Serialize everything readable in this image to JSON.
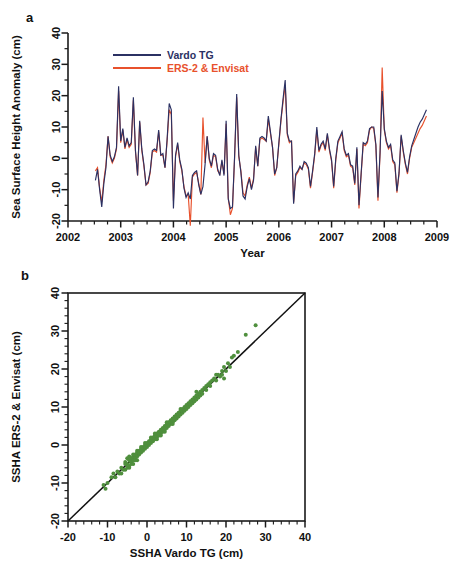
{
  "figure": {
    "panel_a_label": "a",
    "panel_b_label": "b"
  },
  "chart_data": [
    {
      "id": "panel-a",
      "type": "line",
      "title": "",
      "xlabel": "Year",
      "ylabel": "Sea Surface Height  Anomaly (cm)",
      "xlim": [
        2002,
        2009
      ],
      "ylim": [
        -20,
        40
      ],
      "xticks": [
        2002,
        2003,
        2004,
        2005,
        2006,
        2007,
        2008,
        2009
      ],
      "yticks": [
        -20,
        -10,
        0,
        10,
        20,
        30,
        40
      ],
      "xtick_labels": [
        "2002",
        "2003",
        "2004",
        "2005",
        "2006",
        "2007",
        "2008",
        "2009"
      ],
      "ytick_labels": [
        "-20",
        "-10",
        "0",
        "10",
        "20",
        "30",
        "40"
      ],
      "minor_ticks_per_major_x": 4,
      "minor_ticks_per_major_y": 2,
      "grid": false,
      "legend_position": "top-center",
      "legend": [
        {
          "name": "Vardo TG",
          "color": "#2b3163"
        },
        {
          "name": "ERS-2 & Envisat",
          "color": "#e8512c"
        }
      ],
      "x": [
        2002.52,
        2002.56,
        2002.6,
        2002.64,
        2002.68,
        2002.72,
        2002.76,
        2002.8,
        2002.84,
        2002.88,
        2002.92,
        2002.96,
        2003.0,
        2003.04,
        2003.08,
        2003.12,
        2003.16,
        2003.2,
        2003.24,
        2003.28,
        2003.32,
        2003.36,
        2003.4,
        2003.44,
        2003.48,
        2003.52,
        2003.56,
        2003.6,
        2003.64,
        2003.68,
        2003.72,
        2003.76,
        2003.8,
        2003.84,
        2003.88,
        2003.92,
        2003.96,
        2004.0,
        2004.04,
        2004.08,
        2004.12,
        2004.16,
        2004.2,
        2004.24,
        2004.28,
        2004.32,
        2004.36,
        2004.4,
        2004.44,
        2004.48,
        2004.52,
        2004.56,
        2004.6,
        2004.64,
        2004.68,
        2004.72,
        2004.76,
        2004.8,
        2004.84,
        2004.88,
        2004.92,
        2004.96,
        2005.0,
        2005.04,
        2005.08,
        2005.12,
        2005.16,
        2005.2,
        2005.24,
        2005.28,
        2005.32,
        2005.36,
        2005.4,
        2005.44,
        2005.48,
        2005.52,
        2005.56,
        2005.6,
        2005.64,
        2005.68,
        2005.72,
        2005.76,
        2005.8,
        2005.84,
        2005.88,
        2005.92,
        2005.96,
        2006.0,
        2006.04,
        2006.08,
        2006.12,
        2006.16,
        2006.2,
        2006.24,
        2006.28,
        2006.32,
        2006.36,
        2006.4,
        2006.44,
        2006.48,
        2006.52,
        2006.56,
        2006.6,
        2006.64,
        2006.68,
        2006.72,
        2006.76,
        2006.8,
        2006.84,
        2006.88,
        2006.92,
        2006.96,
        2007.0,
        2007.04,
        2007.08,
        2007.12,
        2007.16,
        2007.2,
        2007.24,
        2007.28,
        2007.32,
        2007.36,
        2007.4,
        2007.44,
        2007.48,
        2007.52,
        2007.56,
        2007.6,
        2007.64,
        2007.68,
        2007.72,
        2007.76,
        2007.8,
        2007.84,
        2007.88,
        2007.92,
        2007.96,
        2008.0,
        2008.04,
        2008.08,
        2008.12,
        2008.16,
        2008.2,
        2008.24,
        2008.28,
        2008.32,
        2008.36,
        2008.4,
        2008.44,
        2008.48,
        2008.52,
        2008.56,
        2008.6,
        2008.64,
        2008.68,
        2008.72,
        2008.76,
        2008.8
      ],
      "series": [
        {
          "name": "Vardo TG",
          "color": "#2b3163",
          "values": [
            -7.0,
            -3.5,
            -10.0,
            -15.5,
            -8.0,
            -3.0,
            7.0,
            1.0,
            -1.0,
            0.5,
            3.5,
            23.0,
            5.5,
            9.5,
            3.5,
            6.5,
            4.0,
            5.0,
            19.5,
            2.5,
            -5.5,
            12.0,
            3.0,
            -2.0,
            -8.5,
            -7.5,
            -4.0,
            2.5,
            3.0,
            2.5,
            9.0,
            1.0,
            1.5,
            -3.0,
            6.0,
            17.5,
            15.5,
            -16.0,
            1.0,
            5.0,
            -0.5,
            -3.5,
            -9.5,
            -12.5,
            -11.0,
            -13.0,
            -5.5,
            -4.5,
            -4.0,
            -8.5,
            -11.5,
            -9.0,
            -2.0,
            7.0,
            0.0,
            -2.5,
            1.5,
            1.0,
            -3.5,
            -5.5,
            -0.5,
            -5.5,
            12.0,
            -13.0,
            -16.0,
            -15.5,
            0.5,
            20.5,
            1.0,
            -4.5,
            -12.0,
            -13.0,
            -9.0,
            -6.5,
            -10.0,
            -7.0,
            4.0,
            -2.5,
            6.5,
            7.0,
            6.5,
            5.5,
            13.5,
            8.5,
            3.5,
            -5.0,
            -3.0,
            5.0,
            12.5,
            19.0,
            25.0,
            8.0,
            5.5,
            5.5,
            -14.5,
            -5.0,
            -4.0,
            -2.5,
            -3.5,
            -1.0,
            -1.5,
            -3.0,
            -9.0,
            -4.0,
            1.5,
            10.0,
            2.5,
            4.5,
            5.5,
            3.0,
            8.0,
            3.0,
            -0.5,
            -9.0,
            0.0,
            5.5,
            7.0,
            8.5,
            3.0,
            1.0,
            1.5,
            -2.0,
            -2.5,
            -8.0,
            3.5,
            -15.0,
            -5.0,
            5.0,
            4.5,
            5.5,
            9.5,
            10.0,
            10.0,
            4.5,
            -12.5,
            2.0,
            21.5,
            9.5,
            5.5,
            3.5,
            4.5,
            -0.5,
            -1.5,
            -10.5,
            -4.5,
            7.5,
            2.5,
            -1.5,
            -4.5,
            0.5,
            4.0,
            6.0,
            8.0,
            10.0,
            11.5,
            12.5,
            14.0,
            15.5
          ]
        },
        {
          "name": "ERS-2 & Envisat",
          "color": "#e8512c",
          "values": [
            -4.0,
            -3.0,
            -9.5,
            -14.0,
            -7.0,
            -2.0,
            7.0,
            0.5,
            -1.5,
            0.0,
            3.0,
            21.5,
            5.0,
            9.0,
            3.0,
            6.0,
            3.5,
            4.5,
            18.5,
            2.0,
            -5.5,
            11.5,
            2.5,
            -2.5,
            -8.5,
            -8.0,
            -4.5,
            2.0,
            2.5,
            2.0,
            8.5,
            1.0,
            1.0,
            -3.0,
            5.5,
            15.5,
            14.0,
            -13.5,
            0.5,
            4.5,
            -1.0,
            -4.0,
            -9.0,
            -12.0,
            -11.5,
            -21.5,
            -6.0,
            -5.0,
            -4.5,
            -8.0,
            -11.5,
            13.0,
            -1.5,
            7.0,
            -0.5,
            -3.0,
            1.0,
            0.5,
            -4.0,
            -5.0,
            -1.0,
            -5.0,
            11.0,
            -12.5,
            -18.0,
            -16.0,
            0.0,
            19.5,
            0.5,
            -4.0,
            -11.0,
            -12.0,
            -8.5,
            -6.0,
            -9.5,
            -6.5,
            3.5,
            -2.5,
            6.0,
            6.5,
            6.0,
            5.5,
            12.5,
            8.0,
            3.5,
            -5.5,
            -3.0,
            4.5,
            12.0,
            18.0,
            23.5,
            7.5,
            5.0,
            5.5,
            -14.0,
            -5.5,
            -4.5,
            -3.0,
            -3.5,
            -1.5,
            -2.0,
            -3.5,
            -9.5,
            -4.5,
            1.0,
            9.0,
            2.0,
            4.0,
            5.0,
            2.5,
            7.5,
            2.5,
            -1.0,
            -9.5,
            -0.5,
            5.0,
            6.5,
            8.0,
            2.5,
            0.5,
            1.0,
            -2.5,
            -3.0,
            -8.5,
            3.0,
            -16.0,
            -5.5,
            4.5,
            4.0,
            5.0,
            9.0,
            10.0,
            9.5,
            4.0,
            -13.5,
            1.5,
            29.0,
            9.0,
            5.0,
            3.0,
            4.0,
            -1.0,
            -2.0,
            -11.0,
            -5.0,
            7.0,
            2.0,
            -2.0,
            -5.0,
            0.0,
            3.5,
            5.0,
            6.5,
            8.0,
            9.5,
            10.5,
            12.0,
            13.5
          ]
        }
      ]
    },
    {
      "id": "panel-b",
      "type": "scatter",
      "title": "",
      "xlabel": "SSHA Vardo TG (cm)",
      "ylabel": "SSHA  ERS-2 & Envisat (cm)",
      "xlim": [
        -20,
        40
      ],
      "ylim": [
        -20,
        40
      ],
      "xticks": [
        -20,
        -10,
        0,
        10,
        20,
        30,
        40
      ],
      "yticks": [
        -20,
        -10,
        0,
        10,
        20,
        30,
        40
      ],
      "xtick_labels": [
        "-20",
        "-10",
        "0",
        "10",
        "20",
        "30",
        "40"
      ],
      "ytick_labels": [
        "-20",
        "-10",
        "0",
        "10",
        "20",
        "30",
        "40"
      ],
      "minor_ticks_per_major": 5,
      "grid": false,
      "legend_position": "none",
      "point_color": "#4f8f3d",
      "point_size": 2.0,
      "reference_line": {
        "name": "1:1 line",
        "color": "#111111",
        "from": [
          -20,
          -20
        ],
        "to": [
          40,
          40
        ]
      },
      "points": [
        [
          -11.0,
          -10.5
        ],
        [
          -10.5,
          -11.5
        ],
        [
          -10.0,
          -10.0
        ],
        [
          -8.5,
          -7.5
        ],
        [
          -7.5,
          -7.0
        ],
        [
          -7.0,
          -7.5
        ],
        [
          -6.5,
          -6.0
        ],
        [
          -6.0,
          -6.5
        ],
        [
          -5.5,
          -4.5
        ],
        [
          -5.5,
          -6.5
        ],
        [
          -5.0,
          -3.5
        ],
        [
          -5.0,
          -5.0
        ],
        [
          -5.0,
          -6.0
        ],
        [
          -4.5,
          -4.0
        ],
        [
          -4.5,
          -5.5
        ],
        [
          -4.5,
          -3.0
        ],
        [
          -4.0,
          -4.5
        ],
        [
          -4.0,
          -3.5
        ],
        [
          -4.0,
          -5.0
        ],
        [
          -3.5,
          -3.0
        ],
        [
          -3.5,
          -4.0
        ],
        [
          -3.5,
          -2.5
        ],
        [
          -3.0,
          -3.5
        ],
        [
          -3.0,
          -2.5
        ],
        [
          -3.0,
          -4.0
        ],
        [
          -2.5,
          -2.0
        ],
        [
          -2.5,
          -3.0
        ],
        [
          -2.5,
          -1.5
        ],
        [
          -2.0,
          -2.5
        ],
        [
          -2.0,
          -1.5
        ],
        [
          -2.0,
          -2.0
        ],
        [
          -1.5,
          -1.0
        ],
        [
          -1.5,
          -2.0
        ],
        [
          -1.5,
          -1.5
        ],
        [
          -1.0,
          -0.5
        ],
        [
          -1.0,
          -1.5
        ],
        [
          -1.0,
          -1.0
        ],
        [
          -0.5,
          0.0
        ],
        [
          -0.5,
          -1.0
        ],
        [
          -0.5,
          -0.5
        ],
        [
          0.0,
          0.5
        ],
        [
          0.0,
          -0.5
        ],
        [
          0.0,
          0.0
        ],
        [
          0.5,
          1.0
        ],
        [
          0.5,
          0.0
        ],
        [
          0.5,
          0.5
        ],
        [
          1.0,
          1.5
        ],
        [
          1.0,
          0.5
        ],
        [
          1.0,
          1.0
        ],
        [
          1.5,
          2.0
        ],
        [
          1.5,
          1.0
        ],
        [
          1.5,
          1.5
        ],
        [
          2.0,
          2.5
        ],
        [
          2.0,
          1.5
        ],
        [
          2.0,
          2.0
        ],
        [
          2.5,
          3.0
        ],
        [
          2.5,
          2.0
        ],
        [
          2.5,
          2.5
        ],
        [
          3.0,
          3.5
        ],
        [
          3.0,
          2.5
        ],
        [
          3.0,
          3.0
        ],
        [
          3.5,
          4.0
        ],
        [
          3.5,
          3.0
        ],
        [
          3.5,
          3.5
        ],
        [
          4.0,
          4.5
        ],
        [
          4.0,
          3.5
        ],
        [
          4.0,
          4.0
        ],
        [
          4.5,
          5.0
        ],
        [
          4.5,
          4.0
        ],
        [
          4.5,
          4.5
        ],
        [
          5.0,
          5.5
        ],
        [
          5.0,
          4.5
        ],
        [
          5.0,
          5.0
        ],
        [
          5.5,
          6.0
        ],
        [
          5.5,
          5.0
        ],
        [
          5.5,
          5.5
        ],
        [
          6.0,
          6.5
        ],
        [
          6.0,
          5.5
        ],
        [
          6.0,
          6.0
        ],
        [
          6.5,
          7.0
        ],
        [
          6.5,
          6.0
        ],
        [
          6.5,
          6.5
        ],
        [
          7.0,
          7.5
        ],
        [
          7.0,
          6.5
        ],
        [
          7.0,
          7.0
        ],
        [
          7.5,
          8.0
        ],
        [
          7.5,
          7.0
        ],
        [
          7.5,
          7.5
        ],
        [
          8.0,
          8.5
        ],
        [
          8.0,
          7.5
        ],
        [
          8.0,
          8.0
        ],
        [
          8.5,
          9.0
        ],
        [
          8.5,
          8.0
        ],
        [
          9.0,
          9.5
        ],
        [
          9.0,
          8.5
        ],
        [
          9.0,
          9.0
        ],
        [
          9.5,
          10.0
        ],
        [
          9.5,
          9.0
        ],
        [
          10.0,
          10.5
        ],
        [
          10.0,
          9.5
        ],
        [
          10.0,
          10.0
        ],
        [
          10.5,
          11.0
        ],
        [
          10.5,
          10.0
        ],
        [
          11.0,
          11.5
        ],
        [
          11.0,
          10.5
        ],
        [
          11.5,
          12.0
        ],
        [
          11.5,
          11.0
        ],
        [
          12.0,
          12.5
        ],
        [
          12.0,
          11.5
        ],
        [
          12.5,
          13.0
        ],
        [
          12.5,
          12.0
        ],
        [
          13.0,
          13.5
        ],
        [
          13.0,
          12.5
        ],
        [
          13.5,
          14.0
        ],
        [
          13.5,
          13.0
        ],
        [
          14.0,
          14.5
        ],
        [
          14.0,
          13.5
        ],
        [
          14.5,
          15.0
        ],
        [
          15.0,
          15.5
        ],
        [
          15.0,
          14.5
        ],
        [
          15.5,
          16.0
        ],
        [
          16.0,
          16.5
        ],
        [
          16.0,
          15.5
        ],
        [
          16.5,
          17.0
        ],
        [
          17.0,
          17.5
        ],
        [
          17.5,
          17.0
        ],
        [
          18.0,
          18.5
        ],
        [
          18.5,
          18.0
        ],
        [
          19.0,
          19.5
        ],
        [
          19.0,
          18.5
        ],
        [
          19.5,
          20.5
        ],
        [
          20.0,
          19.5
        ],
        [
          20.5,
          21.5
        ],
        [
          21.0,
          20.5
        ],
        [
          21.5,
          23.0
        ],
        [
          22.0,
          23.5
        ],
        [
          23.0,
          24.5
        ],
        [
          25.0,
          29.0
        ],
        [
          27.5,
          31.5
        ],
        [
          -9.0,
          -8.5
        ],
        [
          -8.0,
          -8.5
        ],
        [
          -6.5,
          -7.5
        ],
        [
          -5.5,
          -5.0
        ],
        [
          -4.5,
          -6.0
        ],
        [
          -3.5,
          -5.0
        ],
        [
          -2.5,
          -4.0
        ],
        [
          -1.5,
          -0.5
        ],
        [
          -0.5,
          0.5
        ],
        [
          1.0,
          2.0
        ],
        [
          2.5,
          1.5
        ],
        [
          3.5,
          2.5
        ],
        [
          5.0,
          6.0
        ],
        [
          6.5,
          5.5
        ],
        [
          8.5,
          9.5
        ],
        [
          12.5,
          14.0
        ],
        [
          17.5,
          18.5
        ],
        [
          19.5,
          17.5
        ],
        [
          2.0,
          3.0
        ],
        [
          4.5,
          3.5
        ]
      ]
    }
  ]
}
